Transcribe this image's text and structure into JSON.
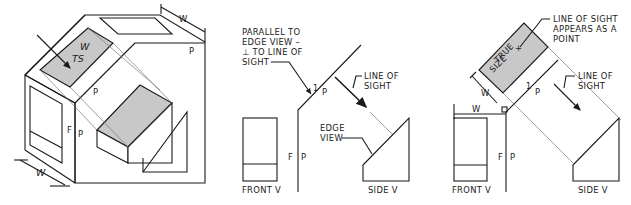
{
  "figure": {
    "panels": [
      {
        "id": "pictorial",
        "labels": {
          "w_top": "W",
          "w_inclined": "W",
          "ts": "TS",
          "p_top_right": "P",
          "p_middle": "P",
          "f": "F",
          "p_fold": "P",
          "w_bottom": "W"
        }
      },
      {
        "id": "edge-view",
        "labels": {
          "parallel_note_1": "PARALLEL TO",
          "parallel_note_2": "EDGE VIEW –",
          "parallel_note_3": "⊥ TO LINE OF",
          "parallel_note_4": "SIGHT",
          "fold_1": "1",
          "fold_p": "P",
          "line_of_sight_1": "LINE OF",
          "line_of_sight_2": "SIGHT",
          "edge_view_1": "EDGE",
          "edge_view_2": "VIEW",
          "f": "F",
          "p": "P",
          "front_view": "FRONT V",
          "side_view": "SIDE V"
        }
      },
      {
        "id": "true-size",
        "labels": {
          "point_note_1": "LINE OF SIGHT",
          "point_note_2": "APPEARS AS A",
          "point_note_3": "POINT",
          "true_1": "TRUE",
          "true_2": "SIZE",
          "w_aux": "W",
          "w_front": "W",
          "fold_1": "1",
          "fold_p": "P",
          "line_of_sight_1": "LINE OF",
          "line_of_sight_2": "SIGHT",
          "f": "F",
          "p": "P",
          "front_view": "FRONT V",
          "side_view": "SIDE V"
        }
      }
    ]
  }
}
